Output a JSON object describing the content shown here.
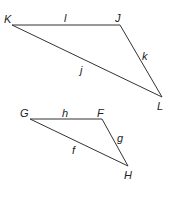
{
  "diagram": {
    "type": "two triangles",
    "triangles": [
      {
        "name": "triangle-JKL",
        "vertices": [
          {
            "label": "K",
            "x": 12,
            "y": 25,
            "lx": 4,
            "ly": 23
          },
          {
            "label": "J",
            "x": 120,
            "y": 25,
            "lx": 115,
            "ly": 22
          },
          {
            "label": "L",
            "x": 162,
            "y": 97,
            "lx": 157,
            "ly": 110
          }
        ],
        "sides": [
          {
            "label": "l",
            "from": "K",
            "to": "J",
            "lx": 64,
            "ly": 22
          },
          {
            "label": "k",
            "from": "J",
            "to": "L",
            "lx": 142,
            "ly": 60
          },
          {
            "label": "j",
            "from": "K",
            "to": "L",
            "lx": 80,
            "ly": 74
          }
        ]
      },
      {
        "name": "triangle-FGH",
        "vertices": [
          {
            "label": "G",
            "x": 30,
            "y": 119,
            "lx": 20,
            "ly": 117
          },
          {
            "label": "F",
            "x": 102,
            "y": 119,
            "lx": 97,
            "ly": 117
          },
          {
            "label": "H",
            "x": 128,
            "y": 166,
            "lx": 124,
            "ly": 179
          }
        ],
        "sides": [
          {
            "label": "h",
            "from": "G",
            "to": "F",
            "lx": 62,
            "ly": 117
          },
          {
            "label": "g",
            "from": "F",
            "to": "H",
            "lx": 117,
            "ly": 142
          },
          {
            "label": "f",
            "from": "G",
            "to": "H",
            "lx": 72,
            "ly": 154
          }
        ]
      }
    ]
  }
}
